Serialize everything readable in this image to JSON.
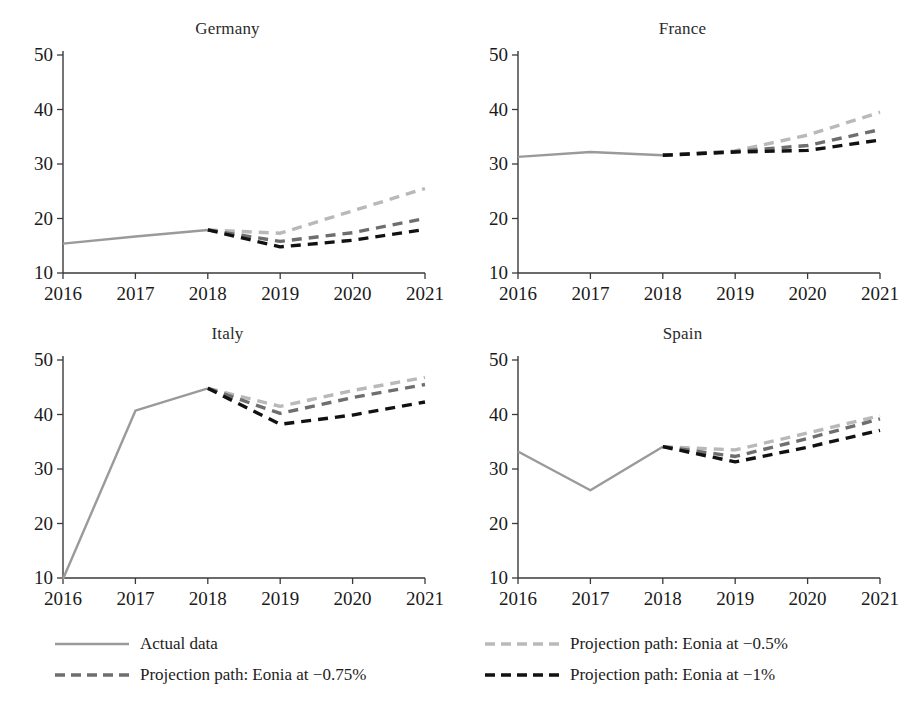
{
  "chart_data": {
    "type": "line",
    "title": "",
    "layout": {
      "rows": 2,
      "cols": 2,
      "grid": false,
      "legend_position": "bottom"
    },
    "x": [
      2016,
      2017,
      2018,
      2019,
      2020,
      2021
    ],
    "xlabel": "",
    "ylabel": "",
    "xlim": [
      2016,
      2021
    ],
    "ylim": [
      10,
      50
    ],
    "xticks": [
      "2016",
      "2017",
      "2018",
      "2019",
      "2020",
      "2021"
    ],
    "yticks": [
      "10",
      "20",
      "30",
      "40",
      "50"
    ],
    "series_names": [
      "Actual data",
      "Projection path: Eonia at −0.5%",
      "Projection path: Eonia at −0.75%",
      "Projection path: Eonia at −1%"
    ],
    "colors": {
      "actual": "#9a9a9a",
      "eonia_050": "#b9b9b9",
      "eonia_075": "#6e6e6e",
      "eonia_100": "#111111",
      "axis": "#3a3a3a",
      "text": "#1a1a1a"
    },
    "panels": [
      {
        "title": "Germany",
        "series": [
          {
            "name": "Actual data",
            "style": "solid",
            "color_key": "actual",
            "x": [
              2016,
              2017,
              2018
            ],
            "values": [
              15.4,
              16.7,
              17.9
            ]
          },
          {
            "name": "Projection path: Eonia at −0.5%",
            "style": "dashed",
            "color_key": "eonia_050",
            "x": [
              2018,
              2019,
              2020,
              2021
            ],
            "values": [
              17.9,
              17.3,
              21.4,
              25.5
            ]
          },
          {
            "name": "Projection path: Eonia at −0.75%",
            "style": "dashed",
            "color_key": "eonia_075",
            "x": [
              2018,
              2019,
              2020,
              2021
            ],
            "values": [
              17.9,
              15.8,
              17.4,
              20.0
            ]
          },
          {
            "name": "Projection path: Eonia at −1%",
            "style": "dashed",
            "color_key": "eonia_100",
            "x": [
              2018,
              2019,
              2020,
              2021
            ],
            "values": [
              17.9,
              14.8,
              16.0,
              18.0
            ]
          }
        ]
      },
      {
        "title": "France",
        "series": [
          {
            "name": "Actual data",
            "style": "solid",
            "color_key": "actual",
            "x": [
              2016,
              2017,
              2018
            ],
            "values": [
              31.3,
              32.2,
              31.6
            ]
          },
          {
            "name": "Projection path: Eonia at −0.5%",
            "style": "dashed",
            "color_key": "eonia_050",
            "x": [
              2018,
              2019,
              2020,
              2021
            ],
            "values": [
              31.6,
              32.4,
              35.3,
              39.5
            ]
          },
          {
            "name": "Projection path: Eonia at −0.75%",
            "style": "dashed",
            "color_key": "eonia_075",
            "x": [
              2018,
              2019,
              2020,
              2021
            ],
            "values": [
              31.6,
              32.3,
              33.4,
              36.3
            ]
          },
          {
            "name": "Projection path: Eonia at −1%",
            "style": "dashed",
            "color_key": "eonia_100",
            "x": [
              2018,
              2019,
              2020,
              2021
            ],
            "values": [
              31.6,
              32.2,
              32.5,
              34.4
            ]
          }
        ]
      },
      {
        "title": "Italy",
        "series": [
          {
            "name": "Actual data",
            "style": "solid",
            "color_key": "actual",
            "x": [
              2016,
              2017,
              2018
            ],
            "values": [
              9.8,
              40.7,
              44.8
            ]
          },
          {
            "name": "Projection path: Eonia at −0.5%",
            "style": "dashed",
            "color_key": "eonia_050",
            "x": [
              2018,
              2019,
              2020,
              2021
            ],
            "values": [
              44.8,
              41.5,
              44.4,
              46.8
            ]
          },
          {
            "name": "Projection path: Eonia at −0.75%",
            "style": "dashed",
            "color_key": "eonia_075",
            "x": [
              2018,
              2019,
              2020,
              2021
            ],
            "values": [
              44.8,
              40.2,
              43.1,
              45.5
            ]
          },
          {
            "name": "Projection path: Eonia at −1%",
            "style": "dashed",
            "color_key": "eonia_100",
            "x": [
              2018,
              2019,
              2020,
              2021
            ],
            "values": [
              44.8,
              38.2,
              39.9,
              42.3
            ]
          }
        ]
      },
      {
        "title": "Spain",
        "series": [
          {
            "name": "Actual data",
            "style": "solid",
            "color_key": "actual",
            "x": [
              2016,
              2017,
              2018
            ],
            "values": [
              33.2,
              26.1,
              34.1
            ]
          },
          {
            "name": "Projection path: Eonia at −0.5%",
            "style": "dashed",
            "color_key": "eonia_050",
            "x": [
              2018,
              2019,
              2020,
              2021
            ],
            "values": [
              34.1,
              33.5,
              36.6,
              39.8
            ]
          },
          {
            "name": "Projection path: Eonia at −0.75%",
            "style": "dashed",
            "color_key": "eonia_075",
            "x": [
              2018,
              2019,
              2020,
              2021
            ],
            "values": [
              34.1,
              32.3,
              35.6,
              39.2
            ]
          },
          {
            "name": "Projection path: Eonia at −1%",
            "style": "dashed",
            "color_key": "eonia_100",
            "x": [
              2018,
              2019,
              2020,
              2021
            ],
            "values": [
              34.1,
              31.3,
              34.0,
              37.1
            ]
          }
        ]
      }
    ]
  },
  "panels": {
    "germany": {
      "title": "Germany"
    },
    "france": {
      "title": "France"
    },
    "italy": {
      "title": "Italy"
    },
    "spain": {
      "title": "Spain"
    }
  },
  "legend": {
    "items": [
      {
        "label": "Actual data",
        "style": "solid",
        "color_key": "actual"
      },
      {
        "label": "Projection path: Eonia at −0.5%",
        "style": "dashed",
        "color_key": "eonia_050"
      },
      {
        "label": "Projection path: Eonia at −0.75%",
        "style": "dashed",
        "color_key": "eonia_075"
      },
      {
        "label": "Projection path: Eonia at −1%",
        "style": "dashed",
        "color_key": "eonia_100"
      }
    ]
  }
}
